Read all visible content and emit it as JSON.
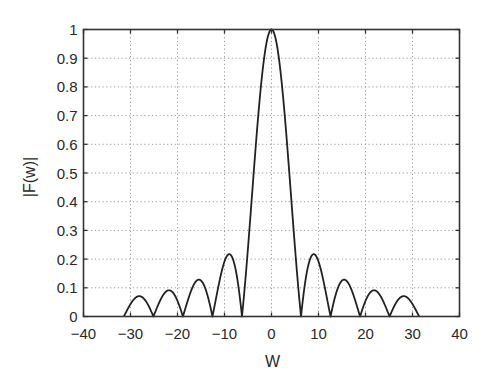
{
  "chart_data": {
    "type": "line",
    "title": "",
    "xlabel": "W",
    "ylabel": "|F(w)|",
    "xlim": [
      -40,
      40
    ],
    "ylim": [
      0,
      1
    ],
    "xticks": [
      -40,
      -30,
      -20,
      -10,
      0,
      10,
      20,
      30,
      40
    ],
    "yticks": [
      0,
      0.1,
      0.2,
      0.3,
      0.4,
      0.5,
      0.6,
      0.7,
      0.8,
      0.9,
      1
    ],
    "xtick_labels": [
      "−40",
      "−30",
      "−20",
      "−10",
      "0",
      "10",
      "20",
      "30",
      "40"
    ],
    "ytick_labels": [
      "0",
      "0.1",
      "0.2",
      "0.3",
      "0.4",
      "0.5",
      "0.6",
      "0.7",
      "0.8",
      "0.9",
      "1"
    ],
    "grid": true,
    "legend": null,
    "series": [
      {
        "name": "|F(w)|",
        "function": "|sin(w/2)/(w/2)|",
        "domain": [
          -31.416,
          31.416
        ],
        "key_points": {
          "peak": {
            "x": 0,
            "y": 1.0
          },
          "zeros": [
            -31.42,
            -25.13,
            -18.85,
            -12.57,
            -6.28,
            6.28,
            12.57,
            18.85,
            25.13,
            31.42
          ],
          "side_lobe_peaks": [
            {
              "x": -28.6,
              "y": 0.071
            },
            {
              "x": -22.3,
              "y": 0.091
            },
            {
              "x": -15.5,
              "y": 0.128
            },
            {
              "x": -9.0,
              "y": 0.217
            },
            {
              "x": 9.0,
              "y": 0.217
            },
            {
              "x": 15.5,
              "y": 0.128
            },
            {
              "x": 22.3,
              "y": 0.091
            },
            {
              "x": 28.6,
              "y": 0.071
            }
          ]
        },
        "color": "#222222"
      }
    ]
  },
  "style": {
    "line_color": "#222222",
    "axis_color": "#333333",
    "grid_color": "#9a9a9a"
  }
}
